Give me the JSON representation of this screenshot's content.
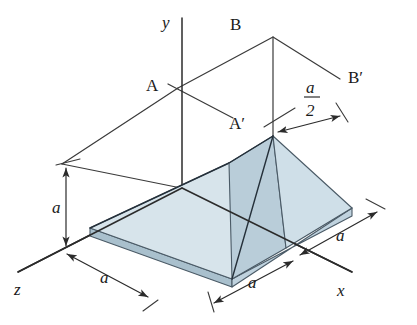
{
  "figure": {
    "background_color": "#ffffff"
  },
  "axes": {
    "y_label": "y",
    "x_label": "x",
    "z_label": "z",
    "line_color": "#2b2b2b"
  },
  "section_labels": {
    "a_left": "A",
    "a_prime": "A′",
    "b_left": "B",
    "b_prime": "B′"
  },
  "dimensions": {
    "height_a": "a",
    "z_depth_a": "a",
    "x_near_a": "a",
    "x_far_a": "a",
    "half_numerator": "a",
    "half_denominator": "2"
  },
  "colors": {
    "plate_top": "#d3e1e9",
    "plate_top_light": "#dce8ef",
    "incline_face": "#b9cdd9",
    "plate_edge_side": "#a9c0cd",
    "plate_edge_front": "#c2d5e0",
    "outline": "#4a5a66",
    "line": "#2b2b2b"
  }
}
